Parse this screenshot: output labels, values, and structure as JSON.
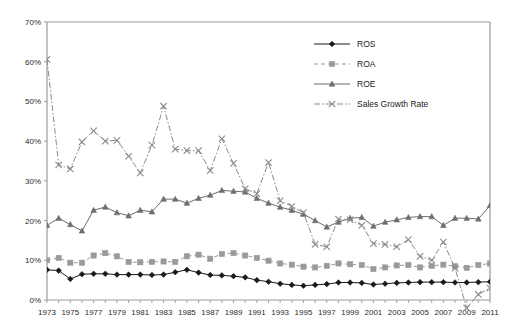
{
  "chart_data": {
    "type": "line",
    "title": "",
    "xlabel": "",
    "ylabel": "",
    "xlim": [
      1973,
      2011
    ],
    "ylim": [
      0,
      70
    ],
    "ytick_labels": [
      "0%",
      "10%",
      "20%",
      "30%",
      "40%",
      "50%",
      "60%",
      "70%"
    ],
    "ytick_values": [
      0,
      10,
      20,
      30,
      40,
      50,
      60,
      70
    ],
    "xtick_labels": [
      "1973",
      "1975",
      "1977",
      "1979",
      "1981",
      "1983",
      "1985",
      "1987",
      "1989",
      "1991",
      "1993",
      "1995",
      "1997",
      "1999",
      "2001",
      "2003",
      "2005",
      "2007",
      "2009",
      "2011"
    ],
    "xtick_values": [
      1973,
      1975,
      1977,
      1979,
      1981,
      1983,
      1985,
      1987,
      1989,
      1991,
      1993,
      1995,
      1997,
      1999,
      2001,
      2003,
      2005,
      2007,
      2009,
      2011
    ],
    "minor_xticks_every": 1,
    "grid": false,
    "legend_position": "top-right",
    "x": [
      1973,
      1974,
      1975,
      1976,
      1977,
      1978,
      1979,
      1980,
      1981,
      1982,
      1983,
      1984,
      1985,
      1986,
      1987,
      1988,
      1989,
      1990,
      1991,
      1992,
      1993,
      1994,
      1995,
      1996,
      1997,
      1998,
      1999,
      2000,
      2001,
      2002,
      2003,
      2004,
      2005,
      2006,
      2007,
      2008,
      2009,
      2010,
      2011
    ],
    "series": [
      {
        "name": "ROS",
        "color": "#1a1a1a",
        "marker": "diamond",
        "dash": "solid",
        "values": [
          7.6,
          7.4,
          5.3,
          6.5,
          6.6,
          6.6,
          6.4,
          6.4,
          6.4,
          6.3,
          6.4,
          7.0,
          7.6,
          6.9,
          6.3,
          6.2,
          6.0,
          5.7,
          5.0,
          4.6,
          4.1,
          3.8,
          3.6,
          3.8,
          4.0,
          4.4,
          4.4,
          4.3,
          3.9,
          4.1,
          4.3,
          4.4,
          4.5,
          4.5,
          4.5,
          4.4,
          4.4,
          4.5,
          4.6
        ]
      },
      {
        "name": "ROA",
        "color": "#9a9a9a",
        "marker": "square",
        "dash": "dashed",
        "values": [
          10.0,
          10.6,
          9.4,
          9.4,
          11.2,
          11.8,
          11.0,
          9.6,
          9.5,
          9.6,
          9.7,
          9.6,
          11.0,
          11.4,
          10.4,
          11.6,
          11.8,
          11.2,
          10.6,
          9.9,
          9.2,
          8.9,
          8.4,
          8.2,
          8.6,
          9.2,
          9.0,
          8.8,
          7.8,
          8.2,
          8.7,
          8.8,
          8.2,
          8.6,
          8.9,
          8.5,
          8.1,
          8.8,
          9.2
        ]
      },
      {
        "name": "ROE",
        "color": "#6e6e6e",
        "marker": "triangle",
        "dash": "solid",
        "values": [
          18.8,
          20.6,
          19.0,
          17.4,
          22.6,
          23.4,
          22.0,
          21.2,
          22.6,
          22.2,
          25.4,
          25.4,
          24.4,
          25.6,
          26.4,
          27.6,
          27.4,
          27.2,
          25.6,
          24.4,
          23.4,
          22.6,
          21.6,
          20.0,
          18.4,
          19.6,
          20.6,
          20.8,
          18.6,
          19.6,
          20.2,
          20.8,
          21.0,
          21.0,
          18.8,
          20.6,
          20.6,
          20.4,
          23.8
        ]
      },
      {
        "name": "Sales Growth Rate",
        "color": "#8a8a8a",
        "marker": "x",
        "dash": "dashdot",
        "values": [
          60.6,
          34.0,
          33.0,
          39.8,
          42.6,
          40.0,
          40.2,
          36.2,
          32.0,
          39.0,
          48.8,
          38.0,
          37.6,
          37.6,
          32.6,
          40.6,
          34.4,
          28.0,
          26.8,
          34.6,
          25.0,
          23.6,
          22.0,
          14.0,
          13.4,
          20.4,
          20.2,
          18.8,
          14.2,
          14.0,
          13.4,
          15.2,
          11.0,
          10.0,
          14.6,
          8.0,
          -2.0,
          1.4,
          3.0
        ]
      }
    ]
  },
  "legend": {
    "items": [
      {
        "label": "ROS"
      },
      {
        "label": "ROA"
      },
      {
        "label": "ROE"
      },
      {
        "label": "Sales Growth Rate"
      }
    ]
  },
  "axes": {
    "axis_color": "#999999",
    "tick_color": "#999999",
    "label_color": "#2b2b2b"
  }
}
